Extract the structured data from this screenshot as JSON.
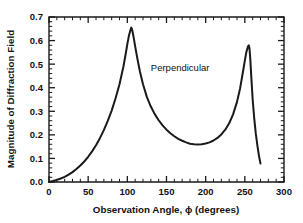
{
  "chart_data": {
    "type": "line",
    "title": "",
    "xlabel": "Observation Angle, ϕ (degrees)",
    "ylabel": "Magnitude of Diffraction Field",
    "xlim": [
      0,
      300
    ],
    "ylim": [
      0.0,
      0.7
    ],
    "grid": false,
    "legend": false,
    "xticks": [
      0,
      50,
      100,
      150,
      200,
      250,
      300
    ],
    "xticklabels": [
      "0",
      "50",
      "100",
      "150",
      "200",
      "250",
      "300"
    ],
    "yticks": [
      0.0,
      0.1,
      0.2,
      0.3,
      0.4,
      0.5,
      0.6,
      0.7
    ],
    "yticklabels": [
      "0.0",
      "0.1",
      "0.2",
      "0.3",
      "0.4",
      "0.5",
      "0.6",
      "0.7"
    ],
    "minor_ticks_per_major_x": 5,
    "minor_ticks_per_major_y": 5,
    "annotations": [
      {
        "text": "Perpendicular",
        "x": 130,
        "y": 0.47
      }
    ],
    "series": [
      {
        "name": "Perpendicular",
        "color": "#1a1a1a",
        "x": [
          0,
          5,
          10,
          15,
          20,
          25,
          30,
          35,
          40,
          45,
          50,
          55,
          60,
          65,
          70,
          75,
          80,
          85,
          90,
          95,
          98,
          100,
          102,
          104,
          105,
          106,
          108,
          110,
          113,
          116,
          120,
          125,
          130,
          135,
          140,
          145,
          150,
          155,
          160,
          165,
          170,
          175,
          180,
          185,
          190,
          195,
          200,
          205,
          210,
          215,
          220,
          225,
          230,
          235,
          240,
          244,
          248,
          250,
          252,
          254,
          255,
          256,
          257,
          258,
          260,
          262,
          264,
          266,
          268,
          270
        ],
        "y": [
          0.0,
          0.004,
          0.009,
          0.015,
          0.022,
          0.031,
          0.042,
          0.055,
          0.07,
          0.087,
          0.107,
          0.13,
          0.156,
          0.186,
          0.22,
          0.259,
          0.303,
          0.355,
          0.415,
          0.49,
          0.545,
          0.585,
          0.62,
          0.645,
          0.655,
          0.648,
          0.615,
          0.575,
          0.52,
          0.47,
          0.415,
          0.36,
          0.32,
          0.288,
          0.262,
          0.24,
          0.222,
          0.207,
          0.194,
          0.183,
          0.175,
          0.168,
          0.162,
          0.16,
          0.159,
          0.16,
          0.163,
          0.168,
          0.176,
          0.187,
          0.202,
          0.222,
          0.249,
          0.287,
          0.34,
          0.398,
          0.475,
          0.515,
          0.552,
          0.575,
          0.58,
          0.565,
          0.52,
          0.46,
          0.35,
          0.27,
          0.205,
          0.155,
          0.112,
          0.078
        ]
      }
    ]
  },
  "axes": {
    "x_title": "Observation Angle, ϕ (degrees)",
    "y_title": "Magnitude of Diffraction Field"
  },
  "colors": {
    "curve": "#1a1a1a",
    "axis": "#1a1a1a",
    "background": "#ffffff"
  }
}
